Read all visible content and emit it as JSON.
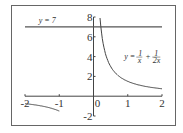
{
  "chart_data": {
    "type": "line",
    "title": "",
    "xlabel": "",
    "ylabel": "",
    "xlim": [
      -2,
      2
    ],
    "ylim": [
      -2,
      8
    ],
    "grid": false,
    "x_ticks": [
      "-2",
      "-1",
      "0",
      "1",
      "2"
    ],
    "y_ticks": [
      "-2",
      "2",
      "4",
      "6",
      "8"
    ],
    "series": [
      {
        "name": "y = 7",
        "type": "horizontal",
        "value": 7,
        "x_range": [
          -2,
          2
        ]
      },
      {
        "name": "y = 1/x + 1/(2x)",
        "function": "1.5/x",
        "branches": [
          [
            0.19,
            2
          ],
          [
            -2,
            -1
          ]
        ]
      }
    ],
    "annotations": [
      {
        "text": "y = 7",
        "x": -1.6,
        "y": 7.4
      },
      {
        "text": "y = 1/x + 1/2x",
        "x": 0.9,
        "y": 3.8
      }
    ]
  }
}
